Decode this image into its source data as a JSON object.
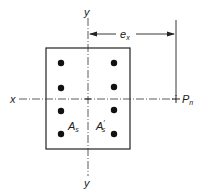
{
  "diagram": {
    "labels": {
      "y_top": "y",
      "y_bottom": "y",
      "x_left": "x",
      "load": "P",
      "load_sub": "n",
      "eccentricity": "e",
      "eccentricity_sub": "x",
      "steel_left": "A",
      "steel_left_sub": "s",
      "steel_right": "A",
      "steel_right_sub": "s",
      "steel_right_prime": "′"
    },
    "bars": {
      "columns": 2,
      "rows": 4,
      "count": 8
    },
    "colors": {
      "line": "#222222",
      "bar_fill": "#111111",
      "background": "#ffffff"
    }
  }
}
